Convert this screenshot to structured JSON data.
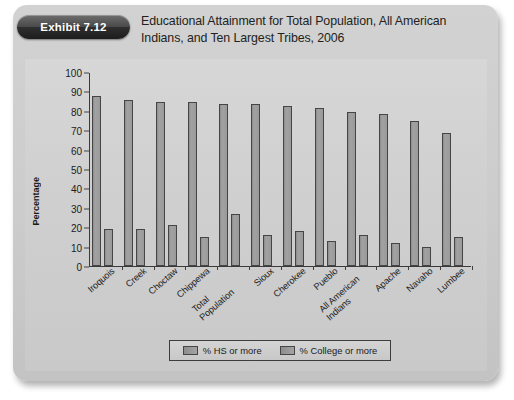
{
  "exhibit": {
    "badge_label": "Exhibit 7.12",
    "title": "Educational Attainment for Total Population, All American Indians, and Ten Largest Tribes, 2006"
  },
  "colors": {
    "card_background": "#cccccc",
    "chart_background": "#d2d2d2",
    "bar_fill": "#9a9a9a",
    "bar_border": "#454545",
    "axis": "#3a3a3a",
    "badge_background": "#2e2e2e",
    "text": "#1c1c1c"
  },
  "chart_data": {
    "type": "bar",
    "title": "Educational Attainment for Total Population, All American Indians, and Ten Largest Tribes, 2006",
    "xlabel": "",
    "ylabel": "Percentage",
    "ylim": [
      0,
      100
    ],
    "ytick_step": 10,
    "yticks": [
      0,
      10,
      20,
      30,
      40,
      50,
      60,
      70,
      80,
      90,
      100
    ],
    "grid": false,
    "legend_position": "bottom",
    "categories": [
      "Iroquois",
      "Creek",
      "Choctaw",
      "Chippewa",
      "Total Population",
      "Sioux",
      "Cherokee",
      "Pueblo",
      "All American Indians",
      "Apache",
      "Navaho",
      "Lumbee"
    ],
    "series": [
      {
        "name": "% HS or more",
        "values": [
          88,
          86,
          85,
          85,
          84,
          84,
          83,
          82,
          80,
          79,
          75,
          69
        ]
      },
      {
        "name": "% College or more",
        "values": [
          19,
          19,
          21,
          15,
          27,
          16,
          18,
          13,
          16,
          12,
          10,
          15
        ]
      }
    ]
  },
  "legend": {
    "items": [
      {
        "label": "% HS or more"
      },
      {
        "label": "% College or more"
      }
    ]
  }
}
